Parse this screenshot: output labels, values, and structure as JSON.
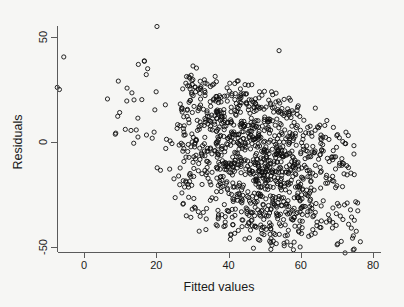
{
  "figure": {
    "background_color": "#f6f6f4",
    "marker_color": "#101010",
    "axis_color": "#5b5b5b",
    "marker_shape": "open-circle",
    "marker_radius_px": 2.1
  },
  "chart_data": {
    "type": "scatter",
    "title": "",
    "subtitle": "",
    "xlabel": "Fitted values",
    "ylabel": "Residuals",
    "xlim": [
      -9,
      81
    ],
    "ylim": [
      -57,
      59
    ],
    "xticks": [
      0,
      20,
      40,
      60,
      80
    ],
    "xticklabels": [
      "0",
      "20",
      "40",
      "60",
      "80"
    ],
    "yticks": [
      50,
      0,
      -50
    ],
    "yticklabels": [
      "50",
      "0",
      "-50"
    ],
    "grid": false,
    "legend": null,
    "annotations": [],
    "n_points": 1180,
    "bands": [
      {
        "intercept": 46,
        "slope": -0.62,
        "x_start": 14,
        "x_end": 78,
        "weight": 0.2,
        "spread": 4.5
      },
      {
        "intercept": 30,
        "slope": -0.58,
        "x_start": 10,
        "x_end": 78,
        "weight": 0.26,
        "spread": 4.5
      },
      {
        "intercept": 14,
        "slope": -0.55,
        "x_start": 8,
        "x_end": 78,
        "weight": 0.26,
        "spread": 4.5
      },
      {
        "intercept": -2,
        "slope": -0.52,
        "x_start": 14,
        "x_end": 78,
        "weight": 0.18,
        "spread": 4.5
      },
      {
        "intercept": -18,
        "slope": -0.48,
        "x_start": 22,
        "x_end": 78,
        "weight": 0.1,
        "spread": 4.5
      }
    ],
    "density_core": {
      "x_center": 48,
      "x_sigma": 13,
      "x_min": 26,
      "x_max": 77
    },
    "sparse_tail": {
      "x_min": -7,
      "x_max": 30,
      "fraction": 0.09
    },
    "outliers": [
      {
        "x": 20.2,
        "y": 55.0
      },
      {
        "x": -5.6,
        "y": 40.5
      },
      {
        "x": -7.4,
        "y": 26.0
      },
      {
        "x": -6.8,
        "y": 25.0
      },
      {
        "x": 54.0,
        "y": 43.5
      },
      {
        "x": 76.5,
        "y": -47.5
      },
      {
        "x": 74.0,
        "y": -41.0
      },
      {
        "x": 13.0,
        "y": 5.5
      },
      {
        "x": 9.5,
        "y": 29.0
      },
      {
        "x": 6.5,
        "y": 20.5
      }
    ]
  },
  "axes": {
    "x_axis_name": "x-axis",
    "y_axis_name": "y-axis",
    "x_label_text": "Fitted values",
    "y_label_text": "Residuals"
  }
}
